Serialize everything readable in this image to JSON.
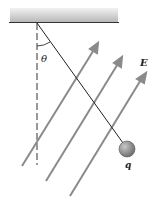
{
  "diagram": {
    "labels": {
      "angle": "θ",
      "field": "E",
      "charge": "q"
    },
    "colors": {
      "ceiling": "#cfcfcf",
      "ceiling_edge": "#333333",
      "field_lines": "#8a8a8a",
      "string": "#222222",
      "ball": "#8c8c8c",
      "dashed": "#333333"
    }
  }
}
